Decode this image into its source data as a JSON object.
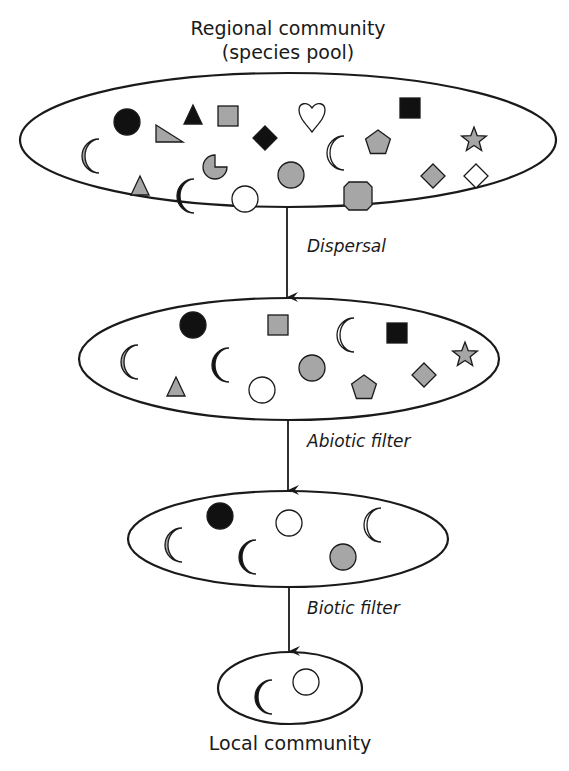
{
  "labels": {
    "regional_line1": "Regional community",
    "regional_line2": "(species pool)",
    "step1": "Dispersal",
    "step2": "Abiotic filter",
    "step3": "Biotic filter",
    "local": "Local community"
  },
  "colors": {
    "gray_fill": "#a6a6a6",
    "black_fill": "#111111",
    "white_fill": "#ffffff",
    "stroke": "#1a1a1a"
  },
  "stages": [
    {
      "name": "regional-community",
      "ellipse": {
        "cx": 288,
        "cy": 140,
        "rx": 268,
        "ry": 67
      },
      "species": [
        {
          "shape": "circle",
          "fill": "black",
          "x": 127,
          "y": 122
        },
        {
          "shape": "triangle",
          "fill": "black",
          "x": 193,
          "y": 116
        },
        {
          "shape": "right-triangle",
          "fill": "gray",
          "x": 169,
          "y": 135
        },
        {
          "shape": "square",
          "fill": "gray",
          "x": 228,
          "y": 116
        },
        {
          "shape": "diamond",
          "fill": "black",
          "x": 265,
          "y": 138
        },
        {
          "shape": "heart",
          "fill": "white",
          "x": 312,
          "y": 116
        },
        {
          "shape": "crescent",
          "fill": "white",
          "x": 335,
          "y": 153
        },
        {
          "shape": "pentagon",
          "fill": "gray",
          "x": 378,
          "y": 142
        },
        {
          "shape": "square",
          "fill": "black",
          "x": 410,
          "y": 108
        },
        {
          "shape": "star",
          "fill": "gray",
          "x": 474,
          "y": 140
        },
        {
          "shape": "crescent",
          "fill": "gray",
          "x": 90,
          "y": 156
        },
        {
          "shape": "pacman",
          "fill": "gray",
          "x": 215,
          "y": 167
        },
        {
          "shape": "triangle",
          "fill": "gray",
          "x": 140,
          "y": 187
        },
        {
          "shape": "crescent",
          "fill": "black",
          "x": 185,
          "y": 196
        },
        {
          "shape": "circle",
          "fill": "white",
          "x": 245,
          "y": 199
        },
        {
          "shape": "circle",
          "fill": "gray",
          "x": 291,
          "y": 175
        },
        {
          "shape": "octagon",
          "fill": "gray",
          "x": 358,
          "y": 196
        },
        {
          "shape": "diamond",
          "fill": "gray",
          "x": 433,
          "y": 176
        },
        {
          "shape": "diamond",
          "fill": "white",
          "x": 476,
          "y": 176
        }
      ]
    },
    {
      "name": "after-dispersal",
      "ellipse": {
        "cx": 289,
        "cy": 359,
        "rx": 210,
        "ry": 61
      },
      "species": [
        {
          "shape": "circle",
          "fill": "black",
          "x": 193,
          "y": 325
        },
        {
          "shape": "square",
          "fill": "gray",
          "x": 278,
          "y": 325
        },
        {
          "shape": "crescent",
          "fill": "white",
          "x": 345,
          "y": 335
        },
        {
          "shape": "square",
          "fill": "black",
          "x": 397,
          "y": 333
        },
        {
          "shape": "star",
          "fill": "gray",
          "x": 465,
          "y": 355
        },
        {
          "shape": "crescent",
          "fill": "gray",
          "x": 129,
          "y": 362
        },
        {
          "shape": "crescent",
          "fill": "black",
          "x": 220,
          "y": 365
        },
        {
          "shape": "circle",
          "fill": "gray",
          "x": 312,
          "y": 368
        },
        {
          "shape": "diamond",
          "fill": "gray",
          "x": 424,
          "y": 375
        },
        {
          "shape": "triangle",
          "fill": "gray",
          "x": 176,
          "y": 388
        },
        {
          "shape": "circle",
          "fill": "white",
          "x": 262,
          "y": 390
        },
        {
          "shape": "pentagon",
          "fill": "gray",
          "x": 364,
          "y": 387
        }
      ]
    },
    {
      "name": "after-abiotic-filter",
      "ellipse": {
        "cx": 288,
        "cy": 539,
        "rx": 160,
        "ry": 48
      },
      "species": [
        {
          "shape": "circle",
          "fill": "black",
          "x": 220,
          "y": 516
        },
        {
          "shape": "circle",
          "fill": "white",
          "x": 289,
          "y": 523
        },
        {
          "shape": "crescent",
          "fill": "white",
          "x": 372,
          "y": 525
        },
        {
          "shape": "crescent",
          "fill": "gray",
          "x": 173,
          "y": 545
        },
        {
          "shape": "crescent",
          "fill": "black",
          "x": 247,
          "y": 557
        },
        {
          "shape": "circle",
          "fill": "gray",
          "x": 343,
          "y": 557
        }
      ]
    },
    {
      "name": "local-community",
      "ellipse": {
        "cx": 290,
        "cy": 688,
        "rx": 72,
        "ry": 36
      },
      "species": [
        {
          "shape": "crescent",
          "fill": "black",
          "x": 263,
          "y": 697
        },
        {
          "shape": "circle",
          "fill": "white",
          "x": 306,
          "y": 682
        }
      ]
    }
  ],
  "arrows": [
    {
      "name": "dispersal-arrow",
      "x": 287,
      "y1": 207,
      "y2": 297
    },
    {
      "name": "abiotic-filter-arrow",
      "x": 288,
      "y1": 420,
      "y2": 490
    },
    {
      "name": "biotic-filter-arrow",
      "x": 289,
      "y1": 587,
      "y2": 651
    }
  ]
}
